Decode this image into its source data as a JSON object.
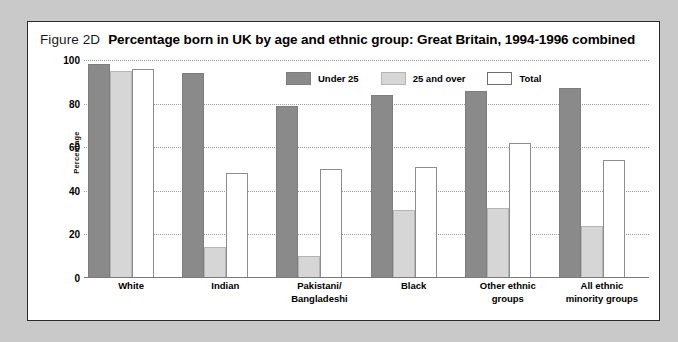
{
  "figure": {
    "number": "Figure 2D",
    "title": "Percentage born in UK by age and ethnic group: Great Britain, 1994-1996 combined"
  },
  "colors": {
    "under25": "#8a8a8a",
    "over25": "#d6d6d6",
    "total": "#ffffff",
    "frame": "#2b2b2b",
    "page_background": "#c9c9c9",
    "gridline": "#9a9a9a"
  },
  "chart_data": {
    "type": "bar",
    "title": "Percentage born in UK by age and ethnic group: Great Britain, 1994-1996 combined",
    "xlabel": "",
    "ylabel": "Percentage",
    "ylim": [
      0,
      100
    ],
    "yticks": [
      100,
      80,
      60,
      40,
      20,
      0
    ],
    "grid": true,
    "legend_position": "top-center",
    "categories": [
      "White",
      "Pakistani/\nBangladeshi",
      "Indian",
      "Black",
      "Other ethnic\ngroups",
      "All ethnic\nminority groups"
    ],
    "category_lines": [
      [
        "White"
      ],
      [
        "Indian"
      ],
      [
        "Pakistani/",
        "Bangladeshi"
      ],
      [
        "Black"
      ],
      [
        "Other ethnic",
        "groups"
      ],
      [
        "All ethnic",
        "minority groups"
      ]
    ],
    "series": [
      {
        "name": "Under 25",
        "values": [
          98,
          94,
          79,
          84,
          86,
          87
        ]
      },
      {
        "name": "25 and over",
        "values": [
          95,
          14,
          10,
          31,
          32,
          24
        ]
      },
      {
        "name": "Total",
        "values": [
          96,
          48,
          50,
          51,
          62,
          54
        ]
      }
    ]
  },
  "legend": [
    {
      "label": "Under 25",
      "key": "under25"
    },
    {
      "label": "25 and over",
      "key": "over25"
    },
    {
      "label": "Total",
      "key": "total"
    }
  ]
}
